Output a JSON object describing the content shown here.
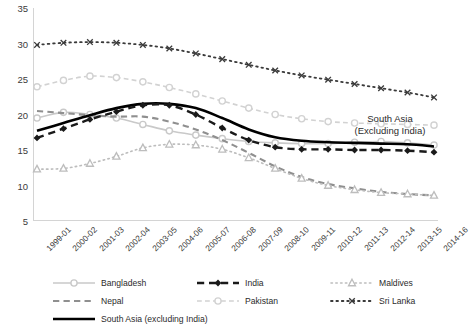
{
  "chart_data": {
    "type": "line",
    "title": "",
    "xlabel": "",
    "ylabel": "",
    "ylim": [
      5,
      35
    ],
    "ytick_step": 5,
    "grid": false,
    "legend_position": "bottom",
    "categories": [
      "1999-01",
      "2000-02",
      "2001-03",
      "2002-04",
      "2003-05",
      "2004-06",
      "2005-07",
      "2006-08",
      "2007-09",
      "2008-10",
      "2009-11",
      "2010-12",
      "2011-13",
      "2012-14",
      "2013-15",
      "2014-16"
    ],
    "yticks": [
      5,
      10,
      15,
      20,
      25,
      30,
      35
    ],
    "series": [
      {
        "name": "Bangladesh",
        "color": "#c9c9c9",
        "style": "solid",
        "marker": "circle",
        "values": [
          19.5,
          20.3,
          20.0,
          19.5,
          18.6,
          17.7,
          17.1,
          16.6,
          16.2,
          16.0,
          15.9,
          15.9,
          16.1,
          16.2,
          16.0,
          15.7
        ]
      },
      {
        "name": "India",
        "color": "#1a1a1a",
        "style": "dashed",
        "marker": "diamond",
        "values": [
          16.7,
          18.0,
          19.3,
          20.4,
          21.3,
          21.3,
          20.0,
          18.1,
          16.4,
          15.4,
          15.1,
          15.1,
          15.0,
          15.0,
          14.9,
          14.7
        ]
      },
      {
        "name": "Maldives",
        "color": "#bdbdbd",
        "style": "dotted",
        "marker": "triangle",
        "values": [
          12.3,
          12.4,
          13.1,
          14.1,
          15.3,
          15.8,
          15.7,
          15.1,
          13.9,
          12.4,
          11.0,
          10.0,
          9.4,
          9.0,
          8.8,
          8.6
        ]
      },
      {
        "name": "Nepal",
        "color": "#8f8f8f",
        "style": "dashed",
        "marker": "none",
        "values": [
          20.5,
          20.2,
          19.9,
          19.7,
          19.7,
          19.0,
          17.9,
          16.4,
          14.6,
          12.7,
          11.2,
          10.2,
          9.6,
          9.1,
          8.8,
          8.6
        ]
      },
      {
        "name": "Pakistan",
        "color": "#d2d2d2",
        "style": "dashed",
        "marker": "circle",
        "values": [
          23.9,
          24.8,
          25.4,
          25.2,
          24.6,
          23.8,
          22.9,
          21.9,
          20.9,
          20.0,
          19.4,
          19.0,
          18.8,
          18.7,
          18.6,
          18.5
        ]
      },
      {
        "name": "Sri Lanka",
        "color": "#3a3a3a",
        "style": "dotted",
        "marker": "x",
        "values": [
          29.8,
          30.1,
          30.2,
          30.1,
          29.8,
          29.3,
          28.6,
          27.8,
          27.0,
          26.2,
          25.5,
          24.9,
          24.3,
          23.7,
          23.1,
          22.4
        ]
      },
      {
        "name": "South Asia (excluding India)",
        "color": "#000000",
        "style": "solid",
        "marker": "none",
        "values": [
          17.7,
          18.8,
          19.9,
          20.9,
          21.5,
          21.5,
          20.9,
          19.5,
          17.9,
          16.8,
          16.3,
          16.1,
          16.0,
          15.9,
          15.8,
          15.5
        ]
      }
    ],
    "annotations": [
      {
        "text_line1": "South Asia",
        "text_line2": "(Excluding India)"
      }
    ]
  },
  "legend": {
    "items": [
      {
        "label": "Bangladesh"
      },
      {
        "label": "India"
      },
      {
        "label": "Maldives"
      },
      {
        "label": "Nepal"
      },
      {
        "label": "Pakistan"
      },
      {
        "label": "Sri Lanka"
      },
      {
        "label": "South Asia (excluding India)"
      }
    ]
  }
}
